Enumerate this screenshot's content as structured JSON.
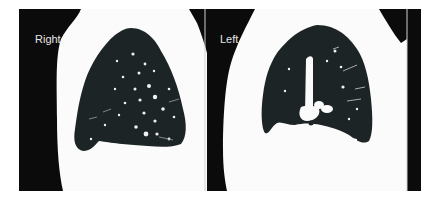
{
  "figure": {
    "panels": [
      {
        "id": "right",
        "label": "Right"
      },
      {
        "id": "left",
        "label": "Left"
      }
    ],
    "colors": {
      "background": "#ffffff",
      "panel_bg": "#0b0b0b",
      "soft_tissue": "#ffffff",
      "lung": "#1c2426",
      "vessel": "#f2f2f2"
    }
  }
}
